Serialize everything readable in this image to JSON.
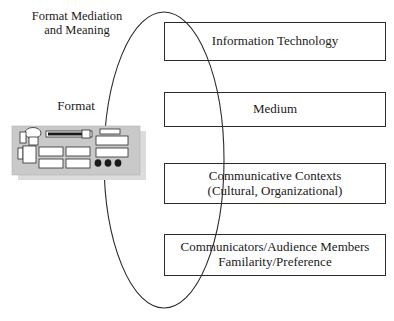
{
  "diagram": {
    "title_label": "Format Mediation\nand Meaning",
    "format_label": "Format",
    "ellipse": {
      "cx": 164,
      "cy": 160,
      "rx": 60,
      "ry": 148,
      "stroke": "#2b2b2b"
    },
    "boxes": [
      {
        "id": "information-technology",
        "text": "Information Technology"
      },
      {
        "id": "medium",
        "text": "Medium"
      },
      {
        "id": "communicative-contexts",
        "text": "Communicative Contexts\n(Cultural, Organizational)"
      },
      {
        "id": "communicators-audience",
        "text": "Communicators/Audience Members\nFamilarity/Preference"
      }
    ],
    "format_device": {
      "name": "format-device-illustration",
      "body_fill": "#c9c9c9",
      "shadow_fill": "#dcdcdc",
      "part_fill": "#ffffff",
      "part_stroke": "#2b2b2b",
      "dark_fill": "#1a1a1a"
    },
    "colors": {
      "line": "#2b2b2b",
      "text": "#1a1a1a",
      "background": "#ffffff"
    }
  }
}
